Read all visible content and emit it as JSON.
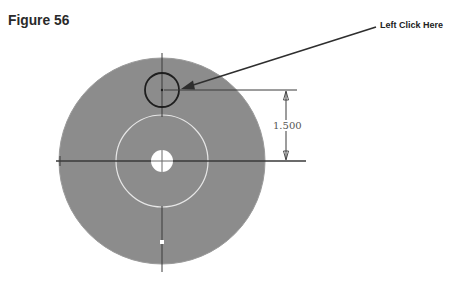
{
  "figure": {
    "title": "Figure 56",
    "callout": "Left Click Here",
    "dimension_value": "1.500"
  },
  "drawing": {
    "colors": {
      "disc_fill": "#8c8c8c",
      "inner_outline": "#e6e6e6",
      "hole_fill": "#ffffff",
      "selected_circle": "#1e1e1e",
      "lines": "#3a3a3a",
      "leader": "#2e2e2e"
    },
    "outer_disc": {
      "cx": 162,
      "cy": 161,
      "r": 103
    },
    "inner_circle": {
      "cx": 162,
      "cy": 161,
      "r": 46
    },
    "center_hole": {
      "cx": 162,
      "cy": 161,
      "r": 11
    },
    "selected_circle": {
      "cx": 162,
      "cy": 90,
      "r": 17
    },
    "dimension": {
      "x": 286,
      "y_top": 90,
      "y_bottom": 161
    }
  }
}
